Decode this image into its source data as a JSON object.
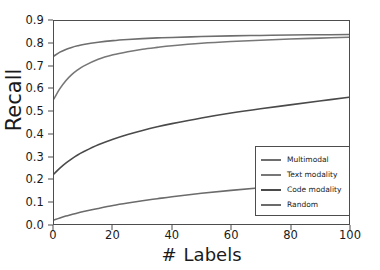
{
  "chart_data": {
    "type": "line",
    "title": "",
    "xlabel_symbol": "#",
    "xlabel_word": "Labels",
    "xlabel": "# Labels",
    "ylabel": "Recall",
    "xlim": [
      0,
      100
    ],
    "ylim": [
      0.0,
      0.9
    ],
    "grid": false,
    "legend_position": "lower right",
    "x_ticks": [
      0,
      20,
      40,
      60,
      80,
      100
    ],
    "x_tick_labels": [
      "0",
      "20",
      "40",
      "60",
      "80",
      "100"
    ],
    "y_ticks": [
      0.0,
      0.1,
      0.2,
      0.3,
      0.4,
      0.5,
      0.6,
      0.7,
      0.8,
      0.9
    ],
    "y_tick_labels": [
      "0.0",
      "0.1",
      "0.2",
      "0.3",
      "0.4",
      "0.5",
      "0.6",
      "0.7",
      "0.8",
      "0.9"
    ],
    "x": [
      0,
      2,
      4,
      6,
      8,
      10,
      15,
      20,
      25,
      30,
      35,
      40,
      50,
      60,
      70,
      80,
      90,
      100
    ],
    "series": [
      {
        "name": "Multimodal",
        "color": "#6e6e6e",
        "values": [
          0.745,
          0.762,
          0.774,
          0.783,
          0.79,
          0.796,
          0.806,
          0.813,
          0.818,
          0.822,
          0.825,
          0.827,
          0.831,
          0.834,
          0.836,
          0.838,
          0.839,
          0.84
        ]
      },
      {
        "name": "Text modality",
        "color": "#777777",
        "values": [
          0.555,
          0.6,
          0.635,
          0.662,
          0.683,
          0.7,
          0.73,
          0.75,
          0.764,
          0.775,
          0.783,
          0.79,
          0.801,
          0.809,
          0.815,
          0.82,
          0.824,
          0.828
        ]
      },
      {
        "name": "Code modality",
        "color": "#4a4a4a",
        "values": [
          0.222,
          0.248,
          0.27,
          0.289,
          0.306,
          0.32,
          0.351,
          0.376,
          0.397,
          0.415,
          0.431,
          0.445,
          0.47,
          0.492,
          0.511,
          0.528,
          0.545,
          0.562
        ]
      },
      {
        "name": "Random",
        "color": "#6b6b6b",
        "values": [
          0.018,
          0.027,
          0.035,
          0.042,
          0.049,
          0.055,
          0.069,
          0.082,
          0.093,
          0.103,
          0.112,
          0.121,
          0.136,
          0.149,
          0.161,
          0.172,
          0.181,
          0.19
        ]
      }
    ]
  },
  "axes": {
    "frame_color": "#4d4d4d"
  },
  "legend": {
    "entries": [
      {
        "label": "Multimodal"
      },
      {
        "label": "Text modality"
      },
      {
        "label": "Code modality"
      },
      {
        "label": "Random"
      }
    ]
  }
}
